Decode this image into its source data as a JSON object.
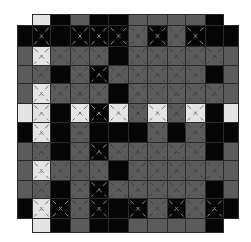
{
  "game": {
    "type": "tile-grid-puzzle",
    "rows": 12,
    "cols": 12,
    "legend": {
      "B": "black tile",
      "G": "gray tile",
      "L": "light tile",
      "x": "crossed-out mark",
      "-": "no tile"
    },
    "colors": {
      "black": "#060606",
      "gray": "#5b5b5b",
      "light": "#e4e4e4",
      "border": "#2a2a2a"
    },
    "col_edges": [
      17,
      32,
      50,
      70,
      89,
      108,
      128,
      147,
      167,
      185,
      205,
      223,
      238
    ],
    "row_edges": [
      14,
      25,
      46,
      65,
      83,
      103,
      122,
      142,
      160,
      180,
      198,
      218,
      232
    ],
    "grid": [
      [
        "-",
        "L",
        "B",
        "G",
        "B",
        "B",
        "G",
        "G",
        "G",
        "G",
        "B",
        "-"
      ],
      [
        "B",
        "Bx",
        "B",
        "Bx",
        "Bx",
        "Bx",
        "Gx",
        "Bx",
        "Gx",
        "Bx",
        "B",
        "B"
      ],
      [
        "G",
        "Lx",
        "Gx",
        "Gx",
        "Gx",
        "B",
        "Gx",
        "Gx",
        "Gx",
        "Gx",
        "Gx",
        "G"
      ],
      [
        "G",
        "Gx",
        "B",
        "Gx",
        "Bx",
        "Gx",
        "Gx",
        "Gx",
        "Gx",
        "Gx",
        "B",
        "G"
      ],
      [
        "G",
        "Lx",
        "Gx",
        "Gx",
        "Gx",
        "B",
        "Gx",
        "Gx",
        "Gx",
        "Gx",
        "Gx",
        "G"
      ],
      [
        "L",
        "Lx",
        "B",
        "Lx",
        "Bx",
        "Lx",
        "Gx",
        "Lx",
        "Gx",
        "Lx",
        "B",
        "L"
      ],
      [
        "B",
        "Lx",
        "B",
        "Gx",
        "B",
        "B",
        "B",
        "Gx",
        "B",
        "Gx",
        "B",
        "B"
      ],
      [
        "G",
        "Gx",
        "B",
        "Gx",
        "Bx",
        "Gx",
        "Gx",
        "Gx",
        "Gx",
        "Gx",
        "B",
        "G"
      ],
      [
        "G",
        "Lx",
        "Gx",
        "Gx",
        "Gx",
        "B",
        "Gx",
        "Gx",
        "Gx",
        "Gx",
        "Gx",
        "G"
      ],
      [
        "G",
        "Gx",
        "B",
        "Gx",
        "Bx",
        "Gx",
        "Gx",
        "Gx",
        "Gx",
        "Gx",
        "B",
        "G"
      ],
      [
        "B",
        "Lx",
        "Bx",
        "Gx",
        "Bx",
        "B",
        "Bx",
        "Gx",
        "Bx",
        "Gx",
        "Bx",
        "B"
      ],
      [
        "-",
        "L",
        "B",
        "G",
        "B",
        "B",
        "G",
        "G",
        "G",
        "G",
        "B",
        "-"
      ]
    ]
  }
}
